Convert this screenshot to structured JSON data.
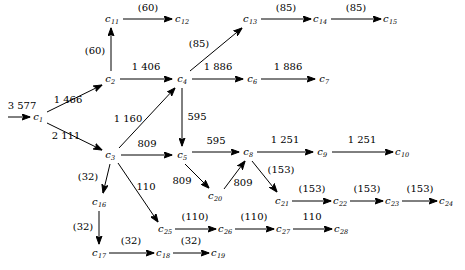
{
  "diagram": {
    "stroke_color": "#000000",
    "background_color": "#ffffff",
    "nodes": [
      {
        "id": "c1",
        "label": "c",
        "sub": "1",
        "x": 38,
        "y": 117
      },
      {
        "id": "c2",
        "label": "c",
        "sub": "2",
        "x": 110,
        "y": 79
      },
      {
        "id": "c3",
        "label": "c",
        "sub": "3",
        "x": 110,
        "y": 155
      },
      {
        "id": "c4",
        "label": "c",
        "sub": "4",
        "x": 182,
        "y": 79
      },
      {
        "id": "c5",
        "label": "c",
        "sub": "5",
        "x": 182,
        "y": 155
      },
      {
        "id": "c6",
        "label": "c",
        "sub": "6",
        "x": 252,
        "y": 79
      },
      {
        "id": "c7",
        "label": "c",
        "sub": "7",
        "x": 324,
        "y": 79
      },
      {
        "id": "c8",
        "label": "c",
        "sub": "8",
        "x": 248,
        "y": 152
      },
      {
        "id": "c9",
        "label": "c",
        "sub": "9",
        "x": 322,
        "y": 152
      },
      {
        "id": "c10",
        "label": "c",
        "sub": "10",
        "x": 402,
        "y": 152
      },
      {
        "id": "c11",
        "label": "c",
        "sub": "11",
        "x": 112,
        "y": 19
      },
      {
        "id": "c12",
        "label": "c",
        "sub": "12",
        "x": 182,
        "y": 19
      },
      {
        "id": "c13",
        "label": "c",
        "sub": "13",
        "x": 250,
        "y": 19
      },
      {
        "id": "c14",
        "label": "c",
        "sub": "14",
        "x": 320,
        "y": 19
      },
      {
        "id": "c15",
        "label": "c",
        "sub": "15",
        "x": 390,
        "y": 19
      },
      {
        "id": "c16",
        "label": "c",
        "sub": "16",
        "x": 99,
        "y": 202
      },
      {
        "id": "c17",
        "label": "c",
        "sub": "17",
        "x": 99,
        "y": 253
      },
      {
        "id": "c18",
        "label": "c",
        "sub": "18",
        "x": 163,
        "y": 253
      },
      {
        "id": "c19",
        "label": "c",
        "sub": "19",
        "x": 218,
        "y": 253
      },
      {
        "id": "c20",
        "label": "c",
        "sub": "20",
        "x": 215,
        "y": 196
      },
      {
        "id": "c21",
        "label": "c",
        "sub": "21",
        "x": 282,
        "y": 201
      },
      {
        "id": "c22",
        "label": "c",
        "sub": "22",
        "x": 340,
        "y": 201
      },
      {
        "id": "c23",
        "label": "c",
        "sub": "23",
        "x": 392,
        "y": 201
      },
      {
        "id": "c24",
        "label": "c",
        "sub": "24",
        "x": 446,
        "y": 201
      },
      {
        "id": "c25",
        "label": "c",
        "sub": "25",
        "x": 165,
        "y": 229
      },
      {
        "id": "c26",
        "label": "c",
        "sub": "26",
        "x": 225,
        "y": 229
      },
      {
        "id": "c27",
        "label": "c",
        "sub": "27",
        "x": 283,
        "y": 229
      },
      {
        "id": "c28",
        "label": "c",
        "sub": "28",
        "x": 341,
        "y": 229
      }
    ],
    "edges": [
      {
        "from": "source",
        "to": "c1",
        "label": "3 577",
        "x1": 8,
        "y1": 117,
        "x2": 30,
        "y2": 117,
        "lx": 22,
        "ly": 106
      },
      {
        "from": "c1",
        "to": "c2",
        "label": "1 466",
        "x1": 47,
        "y1": 112,
        "x2": 102,
        "y2": 85,
        "lx": 68,
        "ly": 100
      },
      {
        "from": "c1",
        "to": "c3",
        "label": "2 111",
        "x1": 47,
        "y1": 123,
        "x2": 102,
        "y2": 150,
        "lx": 66,
        "ly": 136
      },
      {
        "from": "c2",
        "to": "c11",
        "label": "(60)",
        "x1": 111,
        "y1": 71,
        "x2": 111,
        "y2": 28,
        "lx": 95,
        "ly": 51
      },
      {
        "from": "c2",
        "to": "c4",
        "label": "1 406",
        "x1": 120,
        "y1": 79,
        "x2": 172,
        "y2": 79,
        "lx": 146,
        "ly": 67
      },
      {
        "from": "c11",
        "to": "c12",
        "label": "(60)",
        "x1": 123,
        "y1": 19,
        "x2": 172,
        "y2": 19,
        "lx": 148,
        "ly": 8
      },
      {
        "from": "c3",
        "to": "c4",
        "label": "1 160",
        "x1": 119,
        "y1": 148,
        "x2": 175,
        "y2": 88,
        "lx": 128,
        "ly": 119
      },
      {
        "from": "c3",
        "to": "c5",
        "label": "809",
        "x1": 121,
        "y1": 155,
        "x2": 172,
        "y2": 155,
        "lx": 147,
        "ly": 144
      },
      {
        "from": "c3",
        "to": "c16",
        "label": "(32)",
        "x1": 110,
        "y1": 164,
        "x2": 103,
        "y2": 193,
        "lx": 88,
        "ly": 177
      },
      {
        "from": "c3",
        "to": "c25",
        "label": "110",
        "x1": 118,
        "y1": 163,
        "x2": 158,
        "y2": 222,
        "lx": 146,
        "ly": 187
      },
      {
        "from": "c4",
        "to": "c13",
        "label": "(85)",
        "x1": 190,
        "y1": 71,
        "x2": 242,
        "y2": 28,
        "lx": 199,
        "ly": 44
      },
      {
        "from": "c4",
        "to": "c6",
        "label": "1 886",
        "x1": 192,
        "y1": 79,
        "x2": 243,
        "y2": 79,
        "lx": 218,
        "ly": 67
      },
      {
        "from": "c4",
        "to": "c5",
        "label": "595",
        "x1": 182,
        "y1": 88,
        "x2": 182,
        "y2": 146,
        "lx": 197,
        "ly": 117
      },
      {
        "from": "c13",
        "to": "c14",
        "label": "(85)",
        "x1": 261,
        "y1": 19,
        "x2": 311,
        "y2": 19,
        "lx": 286,
        "ly": 8
      },
      {
        "from": "c14",
        "to": "c15",
        "label": "(85)",
        "x1": 331,
        "y1": 19,
        "x2": 381,
        "y2": 19,
        "lx": 356,
        "ly": 8
      },
      {
        "from": "c6",
        "to": "c7",
        "label": "1 886",
        "x1": 261,
        "y1": 79,
        "x2": 315,
        "y2": 79,
        "lx": 288,
        "ly": 67
      },
      {
        "from": "c5",
        "to": "c8",
        "label": "595",
        "x1": 192,
        "y1": 152,
        "x2": 239,
        "y2": 152,
        "lx": 216,
        "ly": 141
      },
      {
        "from": "c5",
        "to": "c20",
        "label": "809",
        "x1": 185,
        "y1": 164,
        "x2": 209,
        "y2": 188,
        "lx": 182,
        "ly": 181
      },
      {
        "from": "c20",
        "to": "c8",
        "label": "809",
        "x1": 224,
        "y1": 189,
        "x2": 245,
        "y2": 161,
        "lx": 243,
        "ly": 183
      },
      {
        "from": "c8",
        "to": "c9",
        "label": "1 251",
        "x1": 257,
        "y1": 152,
        "x2": 313,
        "y2": 152,
        "lx": 285,
        "ly": 140
      },
      {
        "from": "c9",
        "to": "c10",
        "label": "1 251",
        "x1": 332,
        "y1": 152,
        "x2": 393,
        "y2": 152,
        "lx": 362,
        "ly": 140
      },
      {
        "from": "c8",
        "to": "c21",
        "label": "(153)",
        "x1": 252,
        "y1": 161,
        "x2": 277,
        "y2": 192,
        "lx": 281,
        "ly": 170
      },
      {
        "from": "c21",
        "to": "c22",
        "label": "(153)",
        "x1": 292,
        "y1": 201,
        "x2": 331,
        "y2": 201,
        "lx": 312,
        "ly": 189
      },
      {
        "from": "c22",
        "to": "c23",
        "label": "(153)",
        "x1": 350,
        "y1": 201,
        "x2": 383,
        "y2": 201,
        "lx": 367,
        "ly": 189
      },
      {
        "from": "c23",
        "to": "c24",
        "label": "(153)",
        "x1": 402,
        "y1": 201,
        "x2": 437,
        "y2": 201,
        "lx": 420,
        "ly": 189
      },
      {
        "from": "c16",
        "to": "c17",
        "label": "(32)",
        "x1": 99,
        "y1": 211,
        "x2": 99,
        "y2": 244,
        "lx": 83,
        "ly": 227
      },
      {
        "from": "c17",
        "to": "c18",
        "label": "(32)",
        "x1": 109,
        "y1": 253,
        "x2": 154,
        "y2": 253,
        "lx": 131,
        "ly": 241
      },
      {
        "from": "c18",
        "to": "c19",
        "label": "(32)",
        "x1": 173,
        "y1": 253,
        "x2": 209,
        "y2": 253,
        "lx": 191,
        "ly": 241
      },
      {
        "from": "c25",
        "to": "c26",
        "label": "(110)",
        "x1": 175,
        "y1": 229,
        "x2": 216,
        "y2": 229,
        "lx": 195,
        "ly": 217
      },
      {
        "from": "c26",
        "to": "c27",
        "label": "(110)",
        "x1": 235,
        "y1": 229,
        "x2": 274,
        "y2": 229,
        "lx": 254,
        "ly": 217
      },
      {
        "from": "c27",
        "to": "c28",
        "label": "110",
        "x1": 293,
        "y1": 229,
        "x2": 332,
        "y2": 229,
        "lx": 312,
        "ly": 217
      }
    ]
  }
}
